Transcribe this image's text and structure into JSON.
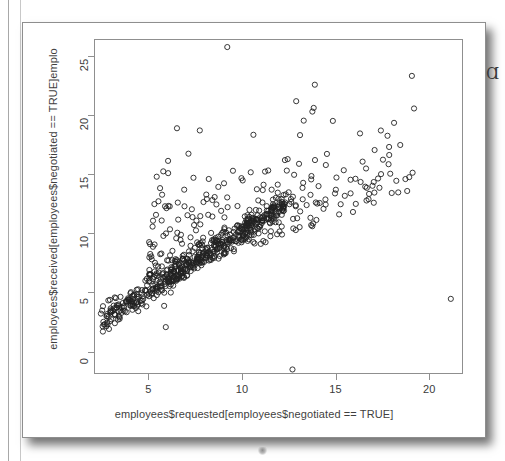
{
  "figure": {
    "kind": "r-base-graphics-scatterplot",
    "background_color": "#ffffff",
    "frame_color": "#8f8f8f",
    "point_color": "#222222"
  },
  "pen_mark": "Ɑ",
  "chart_data": {
    "type": "scatter",
    "title": "",
    "xlabel": "employees$requested[employees$negotiated == TRUE]",
    "ylabel": "employees$received[employees$negotiated == TRUE]emplo",
    "xlim": [
      2.1,
      21.8
    ],
    "ylim": [
      -1.9,
      26.4
    ],
    "xticks": [
      5,
      10,
      15,
      20
    ],
    "yticks": [
      0,
      5,
      10,
      15,
      20,
      25
    ],
    "grid": false,
    "legend": null,
    "marker": {
      "shape": "circle-open",
      "radius_px": 2.6,
      "stroke_width": 0.9
    },
    "n_points": 820,
    "clusters": [
      {
        "name": "diagonal-band",
        "n": 520,
        "x_range": [
          2.4,
          12.4
        ],
        "slope": 1.0,
        "intercept": 0.15,
        "spread": 0.55
      },
      {
        "name": "upper-scatter-cloud",
        "n": 265,
        "x_range": [
          5.0,
          19.5
        ],
        "y_range": [
          3.5,
          23.0
        ]
      }
    ],
    "notable_points": [
      {
        "x": 9.2,
        "y": 25.8,
        "note": "highest point"
      },
      {
        "x": 13.9,
        "y": 22.6
      },
      {
        "x": 12.9,
        "y": 21.2
      },
      {
        "x": 6.5,
        "y": 18.9
      },
      {
        "x": 21.2,
        "y": 4.4,
        "note": "far right outlier"
      },
      {
        "x": 12.7,
        "y": -1.6,
        "note": "lowest point"
      },
      {
        "x": 5.9,
        "y": 2.0
      }
    ]
  }
}
